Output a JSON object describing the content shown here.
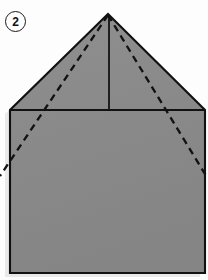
{
  "figure": {
    "step_number": "2",
    "caption": "",
    "kind": "origami-fold-diagram"
  },
  "canvas": {
    "width": 208,
    "height": 280,
    "background_color": "#fdfdfd"
  },
  "colors": {
    "paper_fill": "#8a8a8a",
    "paper_fill_light": "#949494",
    "outline": "#111111",
    "fold_line": "#111111",
    "crease_line": "#1a1a1a",
    "shadow": "#d8d8d8",
    "badge_text": "#111111",
    "badge_background": "#ffffff"
  },
  "shape": {
    "name": "house-pentagon-paper",
    "points": [
      {
        "name": "apex",
        "x": 108,
        "y": 14
      },
      {
        "name": "roof-right-corner",
        "x": 205,
        "y": 110
      },
      {
        "name": "bottom-right-corner",
        "x": 205,
        "y": 273
      },
      {
        "name": "bottom-left-corner",
        "x": 10,
        "y": 273
      },
      {
        "name": "roof-left-corner",
        "x": 10,
        "y": 110
      }
    ],
    "outline_width": 2.1
  },
  "lines": {
    "roof_base": {
      "name": "roof-base-line",
      "style": "solid",
      "x1": 10,
      "y1": 110,
      "x2": 205,
      "y2": 110,
      "width": 2.1
    },
    "center_crease": {
      "name": "vertical-center-crease",
      "style": "solid",
      "x1": 109,
      "y1": 14,
      "x2": 109,
      "y2": 110,
      "width": 1.9
    },
    "fold_left": {
      "name": "left-dashed-fold-line",
      "style": "dashed",
      "x1": 108,
      "y1": 15,
      "x2": 0,
      "y2": 176,
      "width": 2.3,
      "dash": "7 5"
    },
    "fold_right": {
      "name": "right-dashed-fold-line",
      "style": "dashed",
      "x1": 108,
      "y1": 15,
      "x2": 208,
      "y2": 179,
      "width": 2.3,
      "dash": "7 5"
    }
  },
  "shadow": {
    "name": "drop-shadow",
    "offset_x": -5,
    "offset_y": 4,
    "opacity": 0.55
  }
}
